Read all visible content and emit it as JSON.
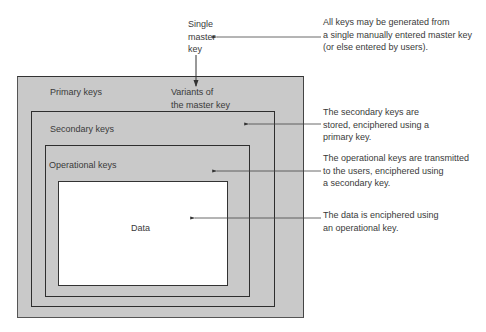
{
  "diagram": {
    "top_node": {
      "label_lines": [
        "Single",
        "master",
        "key"
      ]
    },
    "boxes": {
      "primary": {
        "label": "Primary keys",
        "variants_lines": [
          "Variants of",
          "the master key"
        ]
      },
      "secondary": {
        "label": "Secondary keys"
      },
      "operational": {
        "label": "Operational keys"
      },
      "data": {
        "label": "Data"
      }
    },
    "annotations": [
      {
        "id": "master",
        "lines": [
          "All keys may be generated from",
          "a single manually entered master key",
          "(or else entered by users)."
        ]
      },
      {
        "id": "secondary",
        "lines": [
          "The secondary keys are",
          "stored, enciphered using a",
          "primary key."
        ]
      },
      {
        "id": "operational",
        "lines": [
          "The operational keys are transmitted",
          "to the users, enciphered using",
          "a secondary key."
        ]
      },
      {
        "id": "data",
        "lines": [
          "The data is enciphered using",
          "an operational key."
        ]
      }
    ],
    "colors": {
      "box_fill": "#c9c9c9",
      "data_fill": "#ffffff",
      "line": "#333333",
      "text": "#3a3a3a"
    }
  }
}
